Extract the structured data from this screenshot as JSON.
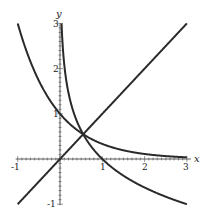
{
  "chart_data": {
    "type": "line",
    "title": "",
    "xlabel": "x",
    "ylabel": "y",
    "xlim": [
      -1,
      3
    ],
    "ylim": [
      -1,
      3
    ],
    "grid": false,
    "x_ticks": [
      "-1",
      "1",
      "2",
      "3"
    ],
    "y_ticks": [
      "-1",
      "1",
      "2",
      "3"
    ],
    "series": [
      {
        "name": "y = x",
        "expr": "x"
      },
      {
        "name": "y = (1/3)^x",
        "expr": "3^(-x)"
      },
      {
        "name": "y = log_(1/3) x",
        "expr": "-ln(x)/ln(3)"
      }
    ]
  },
  "axis": {
    "x": "x",
    "y": "y"
  },
  "ticks": {
    "x": [
      "-1",
      "1",
      "2",
      "3"
    ],
    "y": [
      "-1",
      "1",
      "2",
      "3"
    ]
  }
}
